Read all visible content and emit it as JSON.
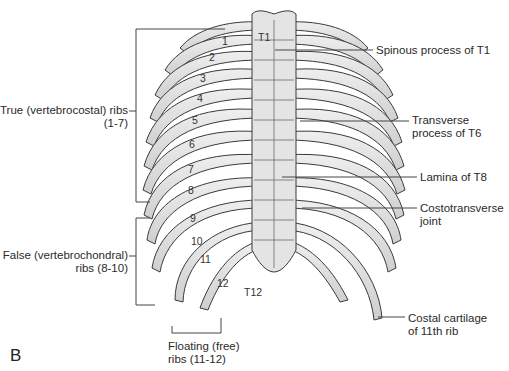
{
  "figure": {
    "panel_letter": "B",
    "vertebra_labels": {
      "top": "T1",
      "bottom": "T12"
    },
    "rib_numbers": [
      "1",
      "2",
      "3",
      "4",
      "5",
      "6",
      "7",
      "8",
      "9",
      "10",
      "11",
      "12"
    ],
    "left_labels": [
      {
        "line1": "True (vertebrocostal) ribs",
        "line2": "(1-7)"
      },
      {
        "line1": "False (vertebrochondral)",
        "line2": "ribs (8-10)"
      }
    ],
    "bottom_label": {
      "line1": "Floating (free)",
      "line2": "ribs (11-12)"
    },
    "right_labels": [
      {
        "line1": "Spinous process of T1",
        "line2": ""
      },
      {
        "line1": "Transverse",
        "line2": "process of T6"
      },
      {
        "line1": "Lamina of T8",
        "line2": ""
      },
      {
        "line1": "Costotransverse",
        "line2": "joint"
      },
      {
        "line1": "Costal cartilage",
        "line2": "of 11th rib"
      }
    ],
    "colors": {
      "bone": "#e6e6e6",
      "bone_shade": "#c8c8c8",
      "cartilage": "#9a9a9a",
      "outline": "#3a3a3a",
      "leader": "#444444"
    }
  }
}
